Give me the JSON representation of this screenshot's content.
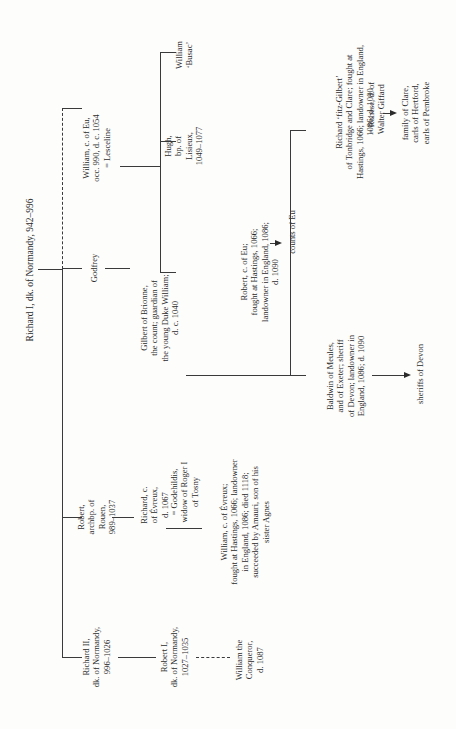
{
  "diagram": {
    "type": "genealogical-tree",
    "orientation": "rotated-90-ccw",
    "root": {
      "id": "richard-i",
      "label": "Richard I, dk. of Normandy, 942–996"
    },
    "nodes": {
      "richard_i": "Richard I, dk. of Normandy, 942–996",
      "richard_ii": "Richard II,\ndk. of Normandy,\n996–1026",
      "robert_archbp": "Robert,\narchbp. of\nRouen,\n989–1037",
      "godfrey": "Godfrey",
      "william_eu": "William, c. of Eu,\nocc. 990, d. c. 1054\n= Lesceline",
      "robert_eu": "Robert, c. of Eu;\nfought at Hastings, 1066;\nlandowner in England, 1086;\nd. 1090",
      "counts_eu": "counts of Eu",
      "hugh": "Hugh,\nbp. of\nLisieux,\n1049–1077",
      "william_busac": "William\n‘Busac’",
      "gilbert": "Gilbert of Brionne,\nthe count; guardian of\nthe young Duke William;\nd. c. 1040",
      "richard_fitz": "Richard ‘fitz-Gilbert’\nof Tonbridge and Clare; fought at\nHastings, 1066; landowner in England,\n1086; d. 1090",
      "richard_fitz_spouse": "= Rohese, d. of\nWalter Giffard",
      "family_clare": "family of Clare,\ncarls of Hertford,\nearls of Pembroke",
      "baldwin": "Baldwin of Meules,\nand of Exeter; sheriff\nof Devon; landowner in\nEngland, 1086; d. 1090",
      "sheriffs_devon": "sheriffs of Devon",
      "richard_evreux": "Richard, c.\nof Évreux,\nd. 1067",
      "godehildis": "= Godehildis,\nwidow of Roger I\nof Tosny",
      "william_evreux": "William, c. of Évreux;\nfought at Hastings, 1066; landowner\nin England, 1086; died 1118;\nsucceeded by Amauri, son of his\nsister Agnes",
      "robert_i": "Robert I,\ndk. of Normandy,\n1027–1035",
      "william_conqueror": "William the\nConqueror,\nd. 1087"
    },
    "edges": [
      {
        "from": "richard_i",
        "to": "richard_ii",
        "style": "solid"
      },
      {
        "from": "richard_i",
        "to": "robert_archbp",
        "style": "solid"
      },
      {
        "from": "richard_i",
        "to": "godfrey",
        "style": "solid"
      },
      {
        "from": "richard_i",
        "to": "william_eu",
        "style": "dashed"
      },
      {
        "from": "william_eu",
        "to": "robert_eu",
        "style": "solid"
      },
      {
        "from": "william_eu",
        "to": "hugh",
        "style": "solid"
      },
      {
        "from": "william_eu",
        "to": "william_busac",
        "style": "solid"
      },
      {
        "from": "robert_eu",
        "to": "counts_eu",
        "style": "arrow"
      },
      {
        "from": "godfrey",
        "to": "gilbert",
        "style": "solid"
      },
      {
        "from": "gilbert",
        "to": "richard_fitz",
        "style": "solid"
      },
      {
        "from": "gilbert",
        "to": "baldwin",
        "style": "solid"
      },
      {
        "from": "richard_fitz",
        "to": "family_clare",
        "style": "arrow"
      },
      {
        "from": "baldwin",
        "to": "sheriffs_devon",
        "style": "arrow"
      },
      {
        "from": "robert_archbp",
        "to": "richard_evreux",
        "style": "solid"
      },
      {
        "from": "richard_evreux",
        "to": "william_evreux",
        "style": "solid"
      },
      {
        "from": "richard_ii",
        "to": "robert_i",
        "style": "solid"
      },
      {
        "from": "robert_i",
        "to": "william_conqueror",
        "style": "dashed"
      }
    ]
  }
}
